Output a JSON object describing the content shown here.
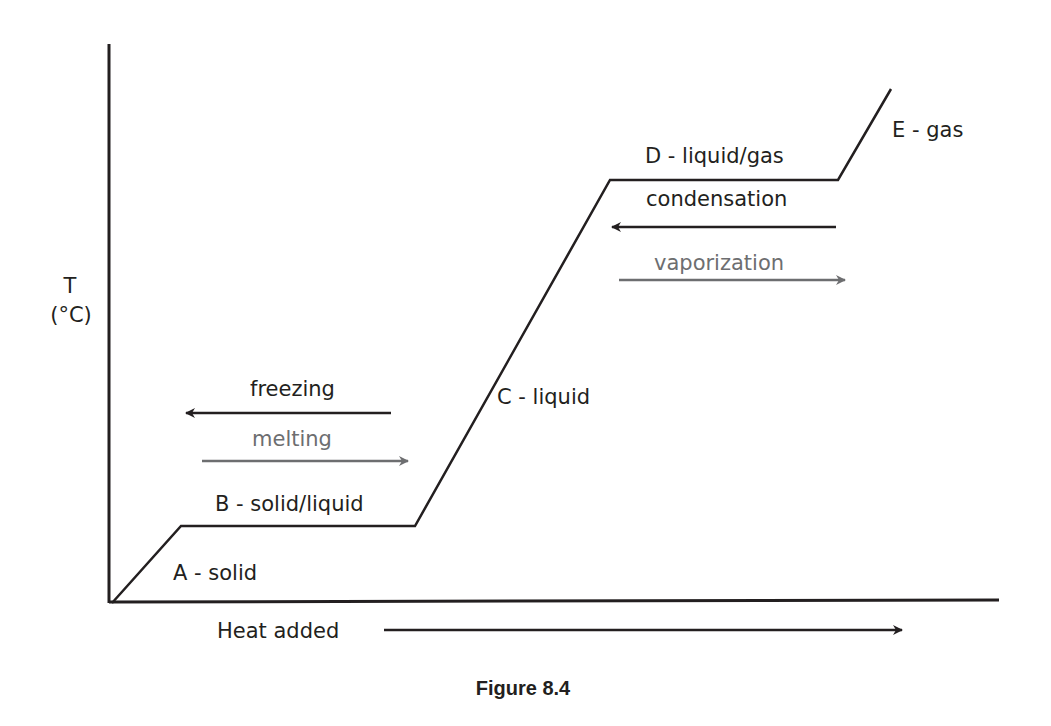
{
  "figure": {
    "caption": "Figure 8.4",
    "y_axis_label_line1": "T",
    "y_axis_label_line2": "(°C)",
    "x_axis_label": "Heat added"
  },
  "segments": {
    "a": "A - solid",
    "b": "B - solid/liquid",
    "c": "C - liquid",
    "d": "D - liquid/gas",
    "e": "E - gas"
  },
  "transitions": {
    "freezing": {
      "label": "freezing",
      "direction": "left",
      "color": "#231f20"
    },
    "melting": {
      "label": "melting",
      "direction": "right",
      "color": "#6d6e70"
    },
    "condensation": {
      "label": "condensation",
      "direction": "left",
      "color": "#231f20"
    },
    "vaporization": {
      "label": "vaporization",
      "direction": "right",
      "color": "#6d6e70"
    }
  },
  "colors": {
    "line": "#231f20",
    "gray_arrow": "#6d6e70",
    "background": "#ffffff"
  }
}
